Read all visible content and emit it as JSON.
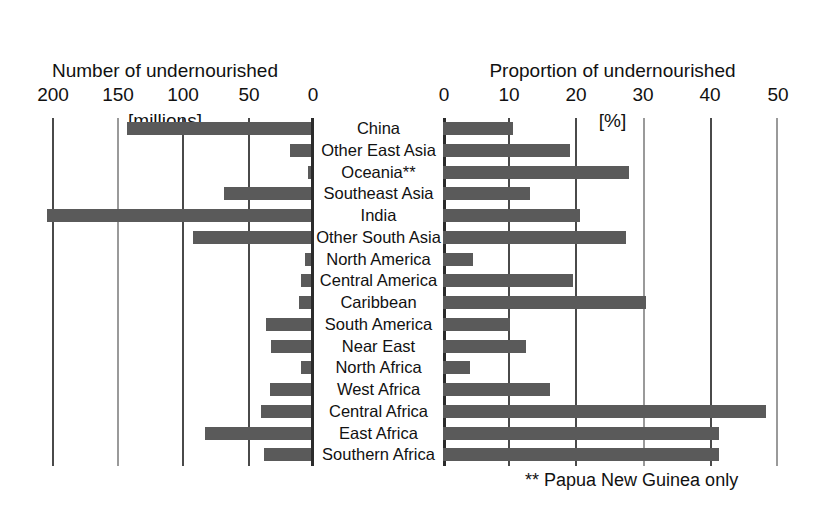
{
  "chart_data": {
    "type": "bar",
    "orientation": "horizontal",
    "panels": [
      {
        "id": "left",
        "title": "Number of undernourished\n[millions]",
        "title_line1": "Number of undernourished",
        "title_line2": "[millions]",
        "xlabel": "Number of undernourished [millions]",
        "ticks": [
          200,
          150,
          100,
          50,
          0
        ],
        "tick_labels": [
          "200",
          "150",
          "100",
          "50",
          "0"
        ],
        "xlim": [
          200,
          0
        ],
        "direction": "right-to-left",
        "grid": true,
        "values": [
          142,
          16,
          2,
          67,
          204,
          91,
          5,
          8,
          9,
          35,
          31,
          8,
          32,
          39,
          82,
          36
        ]
      },
      {
        "id": "right",
        "title": "Proportion of undernourished\n[%]",
        "title_line1": "Proportion of undernourished",
        "title_line2": "[%]",
        "xlabel": "Proportion of undernourished [%]",
        "ticks": [
          0,
          10,
          20,
          30,
          40,
          50
        ],
        "tick_labels": [
          "0",
          "10",
          "20",
          "30",
          "40",
          "50"
        ],
        "xlim": [
          0,
          50
        ],
        "direction": "left-to-right",
        "grid": true,
        "values": [
          10.5,
          19,
          28,
          13,
          20.5,
          27.5,
          4.5,
          19.5,
          30.5,
          10,
          12.5,
          4,
          16,
          48.5,
          41.5,
          41.5
        ]
      }
    ],
    "categories": [
      "China",
      "Other East Asia",
      "Oceania**",
      "Southeast Asia",
      "India",
      "Other South Asia",
      "North America",
      "Central America",
      "Caribbean",
      "South America",
      "Near East",
      "North Africa",
      "West Africa",
      "Central Africa",
      "East Africa",
      "Southern Africa"
    ],
    "legend": [],
    "annotations": [
      "** Papua New Guinea only"
    ],
    "bar_color": "#5a5a5a",
    "grid_color": "#4a4a4a"
  },
  "footnote": "** Papua New Guinea only"
}
